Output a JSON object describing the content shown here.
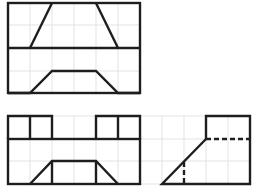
{
  "diagram": {
    "type": "orthographic-three-view",
    "colors": {
      "line": "#1e1e1e",
      "grid": "#e3e3e3",
      "background": "#ffffff"
    },
    "grid": {
      "cell_px": 22,
      "top_view_area": {
        "x": [
          8,
          30,
          52,
          74,
          96,
          118,
          140
        ],
        "y": [
          3,
          25,
          48,
          71,
          93
        ]
      },
      "front_view_area": {
        "x": [
          8,
          30,
          52,
          74,
          96,
          118,
          140,
          162,
          184,
          206,
          228,
          250
        ],
        "y": [
          116,
          139,
          161,
          184
        ]
      }
    },
    "views": [
      {
        "name": "top-view",
        "label": "",
        "bbox": [
          8,
          3,
          140,
          93
        ]
      },
      {
        "name": "front-view",
        "label": "",
        "bbox": [
          8,
          116,
          140,
          184
        ]
      },
      {
        "name": "side-view",
        "label": "",
        "bbox": [
          162,
          116,
          250,
          184
        ]
      }
    ]
  }
}
